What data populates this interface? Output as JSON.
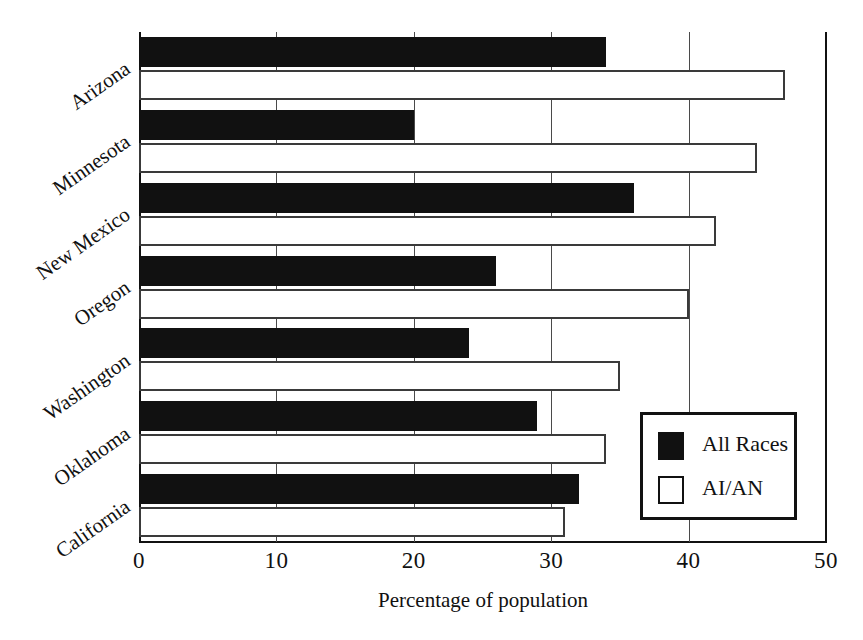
{
  "chart_data": {
    "type": "bar",
    "orientation": "horizontal",
    "title": "",
    "xlabel": "Percentage of population",
    "ylabel": "",
    "xlim": [
      0,
      50
    ],
    "xticks": [
      0,
      10,
      20,
      30,
      40,
      50
    ],
    "grid": true,
    "legend_position": "inner-right",
    "categories": [
      "Arizona",
      "Minnesota",
      "New Mexico",
      "Oregon",
      "Washington",
      "Oklahoma",
      "California"
    ],
    "series": [
      {
        "name": "All Races",
        "color": "#111111",
        "style": "filled",
        "values": [
          34,
          20,
          36,
          26,
          24,
          29,
          32
        ]
      },
      {
        "name": "AI/AN",
        "color": "#ffffff",
        "style": "outlined",
        "values": [
          47,
          45,
          42,
          40,
          35,
          34,
          31
        ]
      }
    ]
  },
  "legend": {
    "items": [
      {
        "label": "All Races",
        "swatch": "dark"
      },
      {
        "label": "AI/AN",
        "swatch": "light"
      }
    ]
  },
  "axis": {
    "x_tick_labels": [
      "0",
      "10",
      "20",
      "30",
      "40",
      "50"
    ],
    "x_title": "Percentage of population"
  }
}
